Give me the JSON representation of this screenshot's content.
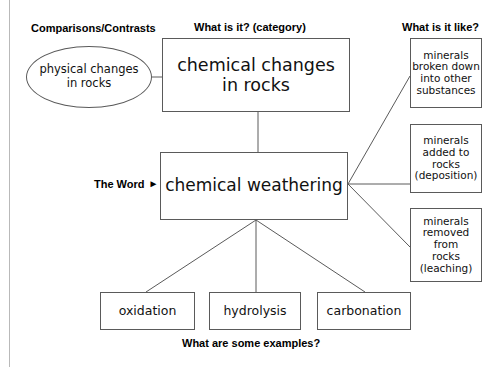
{
  "diagram": {
    "stroke_color": "#5a5a5a",
    "text_color": "#111111",
    "background": "#ffffff"
  },
  "headings": {
    "comparisons": "Comparisons/Contrasts",
    "category": "What is it? (category)",
    "like": "What is it like?",
    "examples": "What are some examples?",
    "the_word": "The Word",
    "the_word_arrow": "►"
  },
  "nodes": {
    "category": {
      "label": "chemical changes\nin rocks",
      "shape": "rectangle"
    },
    "word": {
      "label": "chemical weathering",
      "shape": "rectangle"
    },
    "compare": {
      "label": "physical changes\nin rocks",
      "shape": "ellipse"
    },
    "like": [
      {
        "label": "minerals\nbroken down\ninto other\nsubstances",
        "shape": "rectangle"
      },
      {
        "label": "minerals\nadded to\nrocks\n(deposition)",
        "shape": "rectangle"
      },
      {
        "label": "minerals\nremoved\nfrom\nrocks\n(leaching)",
        "shape": "rectangle"
      }
    ],
    "examples": [
      {
        "label": "oxidation",
        "shape": "rectangle"
      },
      {
        "label": "hydrolysis",
        "shape": "rectangle"
      },
      {
        "label": "carbonation",
        "shape": "rectangle"
      }
    ]
  },
  "connectors": [
    {
      "from": "compare",
      "to": "category"
    },
    {
      "from": "category",
      "to": "word"
    },
    {
      "from": "word",
      "to": "like-1"
    },
    {
      "from": "word",
      "to": "like-2"
    },
    {
      "from": "word",
      "to": "like-3"
    },
    {
      "from": "word",
      "to": "example-1"
    },
    {
      "from": "word",
      "to": "example-2"
    },
    {
      "from": "word",
      "to": "example-3"
    }
  ]
}
